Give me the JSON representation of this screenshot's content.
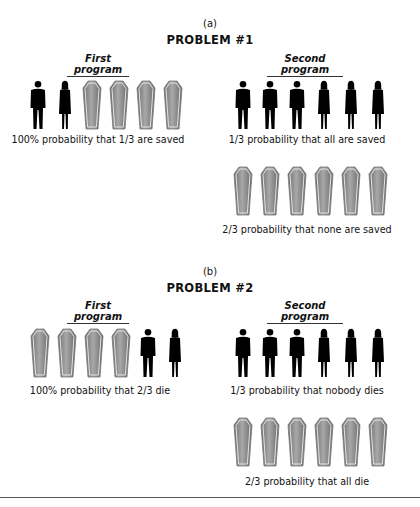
{
  "problems": [
    {
      "panel_label": "(a)",
      "title": "PROBLEM #1",
      "first_program": {
        "label": "First program",
        "icons": [
          "man",
          "woman",
          "coffin",
          "coffin",
          "coffin",
          "coffin"
        ],
        "caption": "100% probability that 1/3 are saved"
      },
      "second_program": {
        "label": "Second program",
        "outcomes": [
          {
            "icons": [
              "man",
              "man",
              "man",
              "woman",
              "woman",
              "woman"
            ],
            "caption": "1/3 probability that all are saved"
          },
          {
            "icons": [
              "coffin",
              "coffin",
              "coffin",
              "coffin",
              "coffin",
              "coffin"
            ],
            "caption": "2/3 probability that none are saved"
          }
        ]
      }
    },
    {
      "panel_label": "(b)",
      "title": "PROBLEM #2",
      "first_program": {
        "label": "First program",
        "icons": [
          "coffin",
          "coffin",
          "coffin",
          "coffin",
          "man",
          "woman"
        ],
        "caption": "100% probability that 2/3 die"
      },
      "second_program": {
        "label": "Second program",
        "outcomes": [
          {
            "icons": [
              "man",
              "man",
              "man",
              "woman",
              "woman",
              "woman"
            ],
            "caption": "1/3 probability that nobody dies"
          },
          {
            "icons": [
              "coffin",
              "coffin",
              "coffin",
              "coffin",
              "coffin",
              "coffin"
            ],
            "caption": "2/3 probability that all die"
          }
        ]
      }
    }
  ],
  "colors": {
    "silhouette": "#000000",
    "coffin_fill": "#8a8a8a",
    "coffin_edge": "#d0d0d0",
    "rule": "#555555"
  }
}
